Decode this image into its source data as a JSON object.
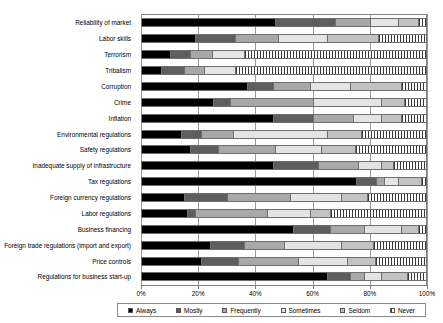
{
  "chart_data": {
    "type": "bar",
    "orientation": "horizontal",
    "stacked": true,
    "normalized": true,
    "title": "",
    "subtitle": "",
    "xlabel": "",
    "ylabel": "",
    "xlim": [
      0,
      100
    ],
    "xticks": [
      0,
      20,
      40,
      60,
      80,
      100
    ],
    "xticklabels": [
      "0%",
      "20%",
      "40%",
      "60%",
      "80%",
      "100%"
    ],
    "grid": true,
    "legend_position": "bottom",
    "legend": [
      "Always",
      "Mostly",
      "Frequently",
      "Sometimes",
      "Seldom",
      "Never"
    ],
    "colors": {
      "Always": "#000000",
      "Mostly": "#5e5e5e",
      "Frequently": "#a8a8a8",
      "Sometimes": "#e4e4e4",
      "Seldom": "#c2c2c2",
      "Never": "#3a3a3a"
    },
    "categories": [
      "Reliability of market",
      "Labor skills",
      "Terrorism",
      "Tribalism",
      "Corruption",
      "Crime",
      "Inflation",
      "Environmental regulations",
      "Safety regulations",
      "Inadequate supply of infrastructure",
      "Tax regulations",
      "Foreign currency regulations",
      "Labor regulations",
      "Business financing",
      "Foreign trade regulations (import and export)",
      "Price controls",
      "Regulations for business start-up"
    ],
    "series": [
      {
        "name": "Always",
        "values": [
          47,
          19,
          10,
          7,
          37,
          25,
          46,
          14,
          17,
          46,
          75,
          15,
          16,
          53,
          24,
          21,
          65
        ]
      },
      {
        "name": "Mostly",
        "values": [
          21,
          14,
          7,
          8,
          9,
          6,
          14,
          7,
          10,
          16,
          7,
          15,
          3,
          13,
          12,
          13,
          8
        ]
      },
      {
        "name": "Frequently",
        "values": [
          12,
          15,
          8,
          7,
          13,
          29,
          14,
          11,
          20,
          14,
          3,
          22,
          25,
          12,
          14,
          21,
          5
        ]
      },
      {
        "name": "Sometimes",
        "values": [
          10,
          17,
          11,
          11,
          14,
          24,
          10,
          33,
          16,
          8,
          5,
          18,
          15,
          13,
          20,
          17,
          6
        ]
      },
      {
        "name": "Seldom",
        "values": [
          7,
          18,
          0,
          0,
          18,
          8,
          7,
          12,
          12,
          4,
          8,
          9,
          7,
          6,
          11,
          10,
          9
        ]
      },
      {
        "name": "Never",
        "values": [
          3,
          17,
          64,
          67,
          9,
          8,
          9,
          23,
          25,
          12,
          2,
          21,
          34,
          3,
          19,
          18,
          7
        ]
      }
    ]
  },
  "legend": {
    "items": [
      {
        "label": "Always",
        "key": "always-key"
      },
      {
        "label": "Mostly",
        "key": "mostly-key"
      },
      {
        "label": "Frequently",
        "key": "frequently-key"
      },
      {
        "label": "Sometimes",
        "key": "sometimes-key"
      },
      {
        "label": "Seldom",
        "key": "seldom-key"
      },
      {
        "label": "Never",
        "key": "never-key"
      }
    ]
  }
}
